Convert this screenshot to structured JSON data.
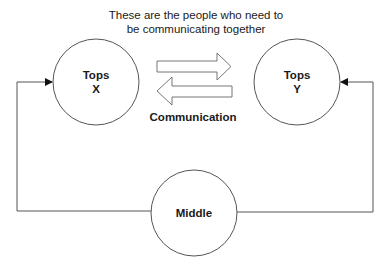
{
  "diagram": {
    "caption_line1": "These are the people who need to",
    "caption_line2": "be communicating together",
    "nodes": {
      "tops_x": {
        "line1": "Tops",
        "line2": "X"
      },
      "tops_y": {
        "line1": "Tops",
        "line2": "Y"
      },
      "middle": {
        "label": "Middle"
      }
    },
    "arrows_label": "Communication",
    "edges": [
      {
        "from": "middle",
        "to": "tops_x",
        "type": "orthogonal-arrow"
      },
      {
        "from": "middle",
        "to": "tops_y",
        "type": "orthogonal-arrow"
      },
      {
        "from": "tops_x",
        "to": "tops_y",
        "type": "block-arrow-right"
      },
      {
        "from": "tops_y",
        "to": "tops_x",
        "type": "block-arrow-left"
      }
    ],
    "colors": {
      "stroke": "#555555",
      "text": "#1a1a1a",
      "background": "#ffffff"
    }
  }
}
